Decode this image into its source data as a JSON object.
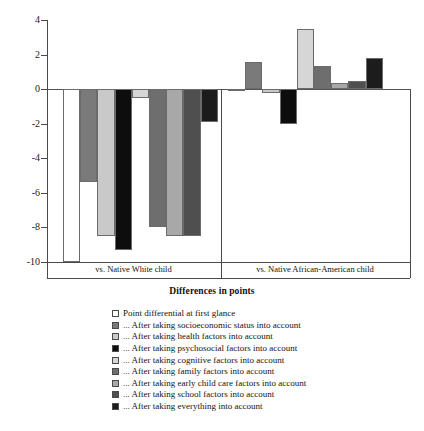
{
  "chart_data": {
    "type": "bar",
    "title": "",
    "xlabel": "Differences in points",
    "ylabel": "",
    "ylim": [
      -10,
      4
    ],
    "ytick_labels": [
      "4",
      "2",
      "0",
      "-2",
      "-4",
      "-6",
      "-8",
      "-10"
    ],
    "ytick_values": [
      4,
      2,
      0,
      -2,
      -4,
      -6,
      -8,
      -10
    ],
    "grid": false,
    "legend_position": "below",
    "categories": [
      "vs. Native White child",
      "vs. Native African-American child"
    ],
    "series": [
      {
        "name": "Point differential at first glance",
        "color": "#ffffff",
        "values": [
          -10.6,
          -0.1
        ]
      },
      {
        "name": "... After taking socioeconomic status into account",
        "color": "#7a7a7a",
        "values": [
          -5.4,
          1.55
        ]
      },
      {
        "name": "... After taking health factors into account",
        "color": "#c9c9c9",
        "values": [
          -8.5,
          -0.2
        ]
      },
      {
        "name": "... After taking psychosocial factors into account",
        "color": "#0d0d0d",
        "values": [
          -9.3,
          -2.0
        ]
      },
      {
        "name": "... After taking cognitive factors into account",
        "color": "#d6d6d6",
        "values": [
          -0.5,
          3.5
        ]
      },
      {
        "name": "... After taking family factors into account",
        "color": "#6e6e6e",
        "values": [
          -8.0,
          1.35
        ]
      },
      {
        "name": "... After taking early child care factors into account",
        "color": "#a8a8a8",
        "values": [
          -8.5,
          0.35
        ]
      },
      {
        "name": "... After taking school factors into account",
        "color": "#4f4f4f",
        "values": [
          -8.5,
          0.5
        ]
      },
      {
        "name": "... After taking everything into account",
        "color": "#1c1c1c",
        "values": [
          -1.9,
          1.8
        ]
      }
    ]
  },
  "axis": {
    "x_title": "Differences in points"
  }
}
